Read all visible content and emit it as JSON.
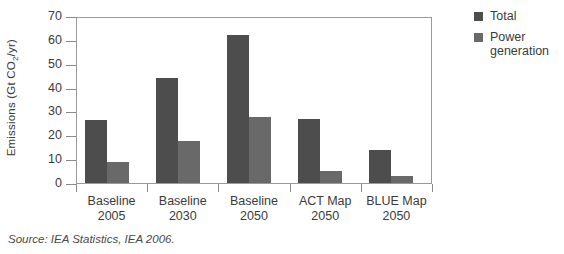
{
  "chart_data": {
    "type": "bar",
    "title": "",
    "xlabel": "",
    "ylabel": "Emissions (Gt CO2/yr)",
    "ylabel_main": "Emissions (Gt CO",
    "ylabel_sub": "2",
    "ylabel_tail": "/yr)",
    "categories": [
      "Baseline 2005",
      "Baseline 2030",
      "Baseline 2050",
      "ACT Map 2050",
      "BLUE Map 2050"
    ],
    "category_lines": [
      {
        "line1": "Baseline",
        "line2": "2005"
      },
      {
        "line1": "Baseline",
        "line2": "2030"
      },
      {
        "line1": "Baseline",
        "line2": "2050"
      },
      {
        "line1": "ACT Map",
        "line2": "2050"
      },
      {
        "line1": "BLUE Map",
        "line2": "2050"
      }
    ],
    "series": [
      {
        "name": "Total",
        "color": "#4d4d4d",
        "values": [
          26.5,
          44,
          62,
          27,
          14
        ]
      },
      {
        "name": "Power generation",
        "color": "#696969",
        "values": [
          9,
          17.5,
          27.5,
          5,
          3
        ]
      }
    ],
    "ylim": [
      0,
      70
    ],
    "yticks": [
      0,
      10,
      20,
      30,
      40,
      50,
      60,
      70
    ],
    "ytick_labels": [
      "0",
      "10",
      "20",
      "30",
      "40",
      "50",
      "60",
      "70"
    ],
    "grid": false,
    "legend_position": "right"
  },
  "legend": {
    "entries": [
      {
        "label": "Total",
        "color": "#4d4d4d"
      },
      {
        "label": "Power generation",
        "label_line1": "Power",
        "label_line2": "generation",
        "color": "#696969"
      }
    ]
  },
  "source": {
    "text": "Source: IEA Statistics, IEA 2006."
  },
  "colors": {
    "total": "#4d4d4d",
    "power_generation": "#696969",
    "axis": "#9a9a9a",
    "text": "#3b3b3b",
    "background": "#ffffff"
  }
}
